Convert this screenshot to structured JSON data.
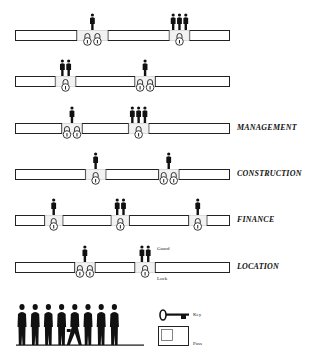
{
  "diagram": {
    "title": "",
    "rows": [
      {
        "label": "",
        "segments": [
          [
            0,
            0.29
          ],
          [
            0.43,
            0.72
          ],
          [
            0.81,
            1.0
          ]
        ],
        "gaps": [
          {
            "guards": 1,
            "locks": 2
          },
          {
            "guards": 3,
            "locks": 1
          }
        ]
      },
      {
        "label": "",
        "segments": [
          [
            0,
            0.19
          ],
          [
            0.28,
            0.56
          ],
          [
            0.65,
            1.0
          ]
        ],
        "gaps": [
          {
            "guards": 2,
            "locks": 1
          },
          {
            "guards": 1,
            "locks": 2
          }
        ]
      },
      {
        "label": "MANAGEMENT",
        "segments": [
          [
            0,
            0.22
          ],
          [
            0.31,
            0.53
          ],
          [
            0.62,
            1.0
          ]
        ],
        "gaps": [
          {
            "guards": 1,
            "locks": 2
          },
          {
            "guards": 3,
            "locks": 1
          }
        ]
      },
      {
        "label": "CONSTRUCTION",
        "segments": [
          [
            0,
            0.33
          ],
          [
            0.42,
            0.67
          ],
          [
            0.76,
            1.0
          ]
        ],
        "gaps": [
          {
            "guards": 1,
            "locks": 1
          },
          {
            "guards": 1,
            "locks": 2
          }
        ]
      },
      {
        "label": "FINANCE",
        "segments": [
          [
            0,
            0.14
          ],
          [
            0.22,
            0.45
          ],
          [
            0.53,
            0.81
          ],
          [
            0.89,
            1.0
          ]
        ],
        "gaps": [
          {
            "guards": 1,
            "locks": 1
          },
          {
            "guards": 2,
            "locks": 1
          },
          {
            "guards": 1,
            "locks": 1
          }
        ]
      },
      {
        "label": "LOCATION",
        "segments": [
          [
            0,
            0.28
          ],
          [
            0.37,
            0.56
          ],
          [
            0.65,
            1.0
          ]
        ],
        "gaps": [
          {
            "guards": 1,
            "locks": 2
          },
          {
            "guards": 2,
            "locks": 1
          }
        ]
      }
    ],
    "annotations": {
      "guard": "Guard",
      "lock": "Lock"
    },
    "legend": {
      "key": "Key",
      "pass": "Pass",
      "people_count": 8
    }
  }
}
